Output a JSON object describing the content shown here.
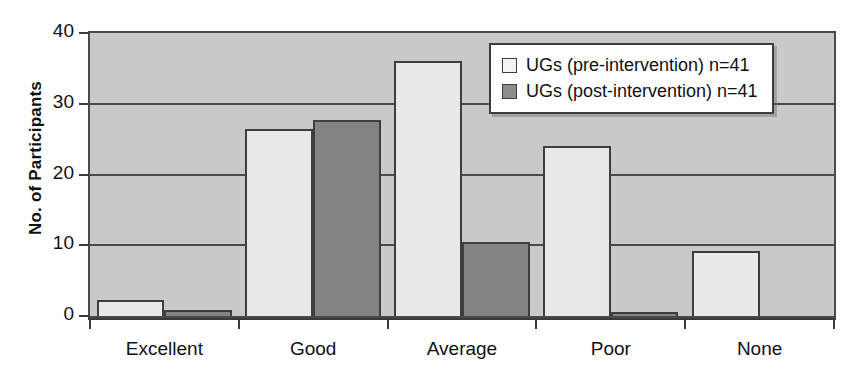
{
  "chart_data": {
    "type": "bar",
    "title": "",
    "xlabel": "",
    "ylabel": "No. of Participants",
    "categories": [
      "Excellent",
      "Good",
      "Average",
      "Poor",
      "None"
    ],
    "series": [
      {
        "name": "UGs (pre-intervention) n=41",
        "color": "#e9e9e9",
        "values": [
          2.3,
          26.5,
          36.1,
          24.0,
          9.2
        ]
      },
      {
        "name": "UGs (post-intervention) n=41",
        "color": "#848484",
        "values": [
          0.8,
          27.7,
          10.5,
          0.5,
          0
        ]
      }
    ],
    "ylim": [
      0,
      40
    ],
    "yticks": [
      0,
      10,
      20,
      30,
      40
    ],
    "ytick_labels": [
      "0",
      "10",
      "20",
      "30",
      "40"
    ],
    "grid": true,
    "legend_position": "top-right",
    "plot_background": "#c9c9c9"
  },
  "legend": {
    "items": [
      {
        "label": "UGs (pre-intervention) n=41",
        "swatch": "pre"
      },
      {
        "label": "UGs (post-intervention) n=41",
        "swatch": "post"
      }
    ]
  },
  "axes": {
    "y_title": "No. of Participants"
  }
}
